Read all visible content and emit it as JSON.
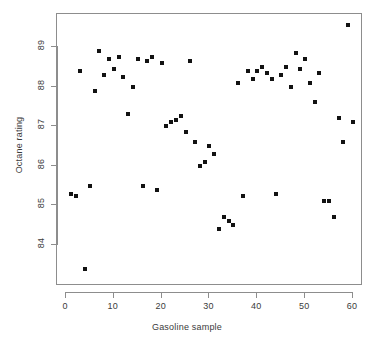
{
  "chart_data": {
    "type": "scatter",
    "title": "",
    "xlabel": "Gasoline sample",
    "ylabel": "Octane rating",
    "xlim": [
      -1.5,
      62
    ],
    "ylim": [
      83.1,
      89.8
    ],
    "xticks": [
      0,
      10,
      20,
      30,
      40,
      50,
      60
    ],
    "yticks": [
      84,
      85,
      86,
      87,
      88,
      89
    ],
    "grid": false,
    "legend": null,
    "marker": "filled-square",
    "marker_color": "#121212",
    "points": [
      {
        "x": 1,
        "y": 85.3
      },
      {
        "x": 2,
        "y": 85.25
      },
      {
        "x": 3,
        "y": 88.4
      },
      {
        "x": 4,
        "y": 83.4
      },
      {
        "x": 5,
        "y": 85.5
      },
      {
        "x": 6,
        "y": 87.9
      },
      {
        "x": 7,
        "y": 88.9
      },
      {
        "x": 8,
        "y": 88.3
      },
      {
        "x": 9,
        "y": 88.7
      },
      {
        "x": 10,
        "y": 88.45
      },
      {
        "x": 11,
        "y": 88.75
      },
      {
        "x": 12,
        "y": 88.25
      },
      {
        "x": 13,
        "y": 87.3
      },
      {
        "x": 14,
        "y": 88.0
      },
      {
        "x": 15,
        "y": 88.7
      },
      {
        "x": 16,
        "y": 85.5
      },
      {
        "x": 17,
        "y": 88.65
      },
      {
        "x": 18,
        "y": 88.75
      },
      {
        "x": 19,
        "y": 85.4
      },
      {
        "x": 20,
        "y": 88.6
      },
      {
        "x": 21,
        "y": 87.0
      },
      {
        "x": 22,
        "y": 87.1
      },
      {
        "x": 23,
        "y": 87.15
      },
      {
        "x": 24,
        "y": 87.25
      },
      {
        "x": 25,
        "y": 86.85
      },
      {
        "x": 26,
        "y": 88.65
      },
      {
        "x": 27,
        "y": 86.6
      },
      {
        "x": 28,
        "y": 86.0
      },
      {
        "x": 29,
        "y": 86.1
      },
      {
        "x": 30,
        "y": 86.5
      },
      {
        "x": 31,
        "y": 86.3
      },
      {
        "x": 32,
        "y": 84.4
      },
      {
        "x": 33,
        "y": 84.7
      },
      {
        "x": 34,
        "y": 84.6
      },
      {
        "x": 35,
        "y": 84.5
      },
      {
        "x": 36,
        "y": 88.1
      },
      {
        "x": 37,
        "y": 85.25
      },
      {
        "x": 38,
        "y": 88.4
      },
      {
        "x": 39,
        "y": 88.2
      },
      {
        "x": 40,
        "y": 88.4
      },
      {
        "x": 41,
        "y": 88.5
      },
      {
        "x": 42,
        "y": 88.35
      },
      {
        "x": 43,
        "y": 88.2
      },
      {
        "x": 44,
        "y": 85.3
      },
      {
        "x": 45,
        "y": 88.3
      },
      {
        "x": 46,
        "y": 88.5
      },
      {
        "x": 47,
        "y": 88.0
      },
      {
        "x": 48,
        "y": 88.85
      },
      {
        "x": 49,
        "y": 88.45
      },
      {
        "x": 50,
        "y": 88.7
      },
      {
        "x": 51,
        "y": 88.1
      },
      {
        "x": 52,
        "y": 87.6
      },
      {
        "x": 53,
        "y": 88.35
      },
      {
        "x": 54,
        "y": 85.1
      },
      {
        "x": 55,
        "y": 85.1
      },
      {
        "x": 56,
        "y": 84.7
      },
      {
        "x": 57,
        "y": 87.2
      },
      {
        "x": 58,
        "y": 86.6
      },
      {
        "x": 59,
        "y": 89.55
      },
      {
        "x": 60,
        "y": 87.1
      }
    ]
  },
  "axes": {
    "x_title": "Gasoline sample",
    "y_title": "Octane rating",
    "x_tick_labels": [
      "0",
      "10",
      "20",
      "30",
      "40",
      "50",
      "60"
    ],
    "y_tick_labels": [
      "84",
      "85",
      "86",
      "87",
      "88",
      "89"
    ]
  },
  "colors": {
    "marker": "#121212",
    "axis": "#8d8d8d",
    "text": "#3b3b3b",
    "background": "#ffffff"
  }
}
